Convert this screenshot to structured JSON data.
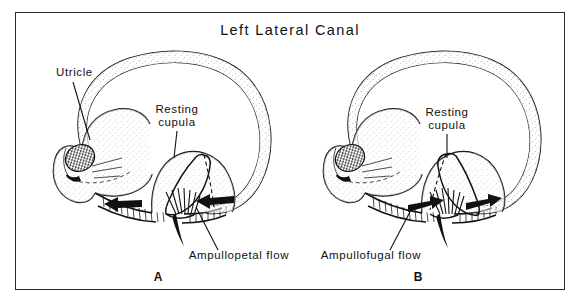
{
  "figure": {
    "title": "Left Lateral Canal",
    "frame": {
      "border_color": "#2b2b2b",
      "background": "#ffffff"
    },
    "ink_color": "#111111"
  },
  "panels": [
    {
      "id": "A",
      "letter": "A",
      "flow_direction": "left",
      "labels": {
        "utricle": "Utricle",
        "cupula_line1": "Resting",
        "cupula_line2": "cupula",
        "flow": "Ampullopetal flow"
      }
    },
    {
      "id": "B",
      "letter": "B",
      "flow_direction": "right",
      "labels": {
        "cupula_line1": "Resting",
        "cupula_line2": "cupula",
        "flow": "Ampullofugal flow"
      }
    }
  ]
}
